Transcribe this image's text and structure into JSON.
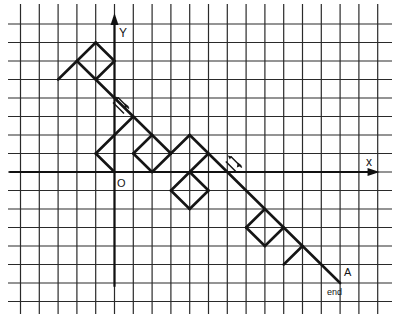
{
  "diagram": {
    "type": "path-on-grid",
    "grid": {
      "origin_px": [
        114.5,
        172
      ],
      "unit_px_x": 18.8,
      "unit_px_y": 18.5,
      "cols": [
        -5,
        14
      ],
      "rows": [
        -7,
        8
      ],
      "extent_px": {
        "x0": 8,
        "x1": 392,
        "y0": 4,
        "y1": 314
      }
    },
    "axes": {
      "x": {
        "label": "x",
        "from": -5.6,
        "to": 14.1
      },
      "y": {
        "label": "Y",
        "from": -6.2,
        "to": 8.6
      },
      "origin_label": "O"
    },
    "segments": [
      {
        "from": [
          -3,
          5
        ],
        "to": [
          -1,
          7
        ]
      },
      {
        "from": [
          -1,
          7
        ],
        "to": [
          0,
          6
        ]
      },
      {
        "from": [
          0,
          6
        ],
        "to": [
          -1,
          5
        ]
      },
      {
        "from": [
          -2,
          6
        ],
        "to": [
          3,
          1
        ]
      },
      {
        "from": [
          0,
          0
        ],
        "to": [
          -1,
          1
        ]
      },
      {
        "from": [
          -1,
          1
        ],
        "to": [
          1,
          3
        ]
      },
      {
        "from": [
          1,
          1
        ],
        "to": [
          2,
          2
        ]
      },
      {
        "from": [
          1,
          1
        ],
        "to": [
          2,
          0
        ]
      },
      {
        "from": [
          2,
          0
        ],
        "to": [
          3,
          1
        ]
      },
      {
        "from": [
          3,
          1
        ],
        "to": [
          4,
          2
        ]
      },
      {
        "from": [
          4,
          2
        ],
        "to": [
          12,
          -6
        ]
      },
      {
        "from": [
          4,
          0
        ],
        "to": [
          5,
          1
        ]
      },
      {
        "from": [
          4,
          0
        ],
        "to": [
          3,
          -1
        ]
      },
      {
        "from": [
          3,
          -1
        ],
        "to": [
          4,
          -2
        ]
      },
      {
        "from": [
          4,
          -2
        ],
        "to": [
          5,
          -1
        ]
      },
      {
        "from": [
          5,
          -1
        ],
        "to": [
          4,
          0
        ]
      },
      {
        "from": [
          8,
          -2
        ],
        "to": [
          7,
          -3
        ]
      },
      {
        "from": [
          7,
          -3
        ],
        "to": [
          8,
          -4
        ]
      },
      {
        "from": [
          8,
          -4
        ],
        "to": [
          9,
          -3
        ]
      },
      {
        "from": [
          9,
          -5
        ],
        "to": [
          10,
          -4
        ]
      }
    ],
    "marks": [
      {
        "type": "double-hash-arrow",
        "at": [
          0.4,
          3.6
        ]
      },
      {
        "type": "double-hash-arrow",
        "at": [
          6.4,
          0.4
        ]
      },
      {
        "type": "single-arrow",
        "at": [
          -0.7,
          1.3
        ]
      }
    ],
    "endpoint": {
      "point": [
        12,
        -6
      ],
      "label": "A",
      "note": "end"
    }
  }
}
